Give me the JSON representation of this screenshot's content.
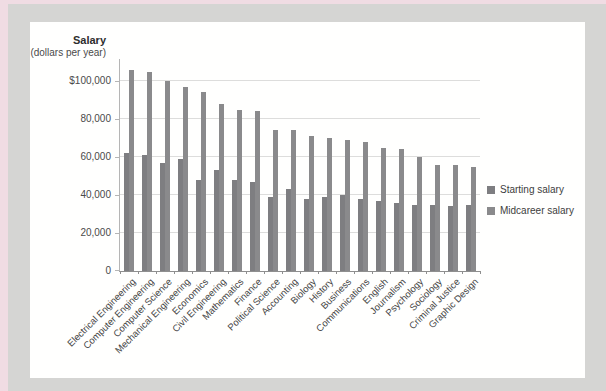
{
  "chart_data": {
    "type": "bar",
    "title": "Salary",
    "subtitle": "(dollars per year)",
    "categories": [
      "Electrical Engineering",
      "Computer Engineering",
      "Computer Science",
      "Mechanical Engineering",
      "Economics",
      "Civil Engineering",
      "Mathematics",
      "Finance",
      "Political Science",
      "Accounting",
      "Biology",
      "History",
      "Business",
      "Communications",
      "English",
      "Journalism",
      "Psychology",
      "Sociology",
      "Criminal Justice",
      "Graphic Design"
    ],
    "series": [
      {
        "name": "Starting salary",
        "color": "#7e7e81",
        "values": [
          62000,
          61000,
          57000,
          59000,
          48000,
          53000,
          48000,
          47000,
          39000,
          43000,
          38000,
          39000,
          40000,
          38000,
          37000,
          36000,
          35000,
          35000,
          34000,
          35000
        ]
      },
      {
        "name": "Midcareer salary",
        "color": "#8a8a8c",
        "values": [
          106000,
          105000,
          100000,
          97000,
          94000,
          88000,
          85000,
          84000,
          74000,
          74000,
          71000,
          70000,
          69000,
          68000,
          65000,
          64000,
          60000,
          56000,
          56000,
          55000
        ]
      }
    ],
    "y_axis": {
      "tick_labels": [
        "$100,000",
        "80,000",
        "60,000",
        "40,000",
        "20,000",
        "0"
      ],
      "tick_values": [
        100000,
        80000,
        60000,
        40000,
        20000,
        0
      ],
      "min": 0,
      "max": 112000
    },
    "grid": true,
    "legend_position": "right",
    "legend": [
      {
        "label": "Starting salary"
      },
      {
        "label": "Midcareer salary"
      }
    ]
  }
}
